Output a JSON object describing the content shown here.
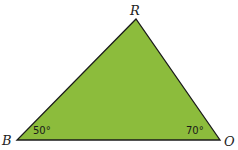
{
  "diagram": {
    "type": "triangle",
    "fill_color": "#8cbc3c",
    "stroke_color": "#1a1a1a",
    "vertices": [
      {
        "name": "R",
        "x": 136,
        "y": 19
      },
      {
        "name": "B",
        "x": 17,
        "y": 140
      },
      {
        "name": "O",
        "x": 220,
        "y": 140
      }
    ],
    "vertex_labels": {
      "R": "R",
      "B": "B",
      "O": "O"
    },
    "angles": {
      "B": "50°",
      "O": "70°"
    }
  }
}
